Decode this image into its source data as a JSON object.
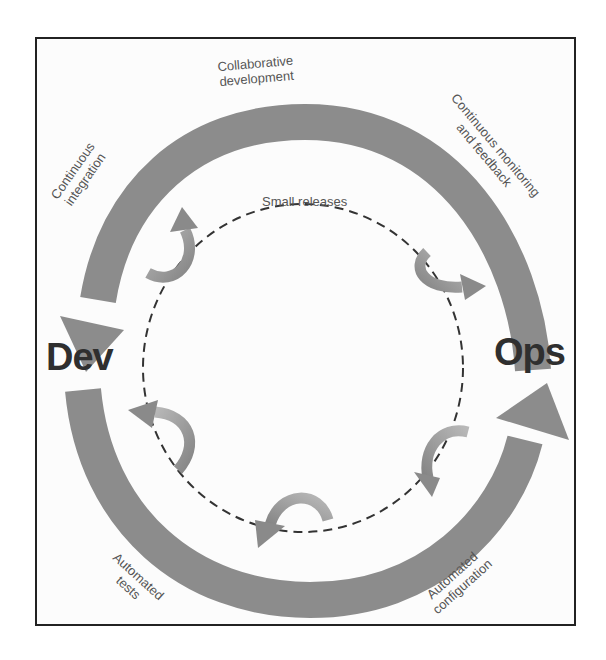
{
  "diagram": {
    "nodes": {
      "dev": "Dev",
      "ops": "Ops"
    },
    "labels": {
      "collaborative_development_1": "Collaborative",
      "collaborative_development_2": "development",
      "continuous_integration_1": "Continuous",
      "continuous_integration_2": "integration",
      "continuous_monitoring_1": "Continuous monitoring",
      "continuous_monitoring_2": "and feedback",
      "small_releases": "Small releases",
      "automated_tests_1": "Automated",
      "automated_tests_2": "tests",
      "automated_configuration_1": "Automated",
      "automated_configuration_2": "configuration"
    },
    "colors": {
      "arc": "#8c8c8c",
      "small_arrow_dark": "#8a8a8a",
      "small_arrow_light": "#b8b8b8",
      "dashed_circle": "#333333",
      "frame": "#222222",
      "text": "#555555",
      "node_text": "#2f2f2f"
    }
  }
}
